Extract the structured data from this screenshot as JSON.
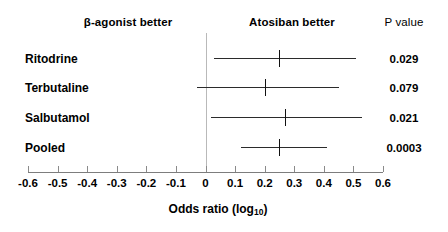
{
  "header": {
    "left_label": "β-agonist better",
    "right_label": "Atosiban better",
    "pvalue_label": "P value"
  },
  "axis": {
    "title_main": "Odds ratio (log",
    "title_sub": "10",
    "title_close": ")",
    "tick_labels": [
      "-0.6",
      "-0.5",
      "-0.4",
      "-0.3",
      "-0.2",
      "-0.1",
      "0",
      "0.1",
      "0.2",
      "0.3",
      "0.4",
      "0.5",
      "0.6"
    ],
    "tick_values": [
      -0.6,
      -0.5,
      -0.4,
      -0.3,
      -0.2,
      -0.1,
      0,
      0.1,
      0.2,
      0.3,
      0.4,
      0.5,
      0.6
    ],
    "min": -0.6,
    "max": 0.6,
    "zero_reference": 0
  },
  "rows": [
    {
      "label": "Ritodrine",
      "pvalue": "0.029",
      "estimate": 0.25,
      "ci_low": 0.03,
      "ci_high": 0.51
    },
    {
      "label": "Terbutaline",
      "pvalue": "0.079",
      "estimate": 0.2,
      "ci_low": -0.03,
      "ci_high": 0.45
    },
    {
      "label": "Salbutamol",
      "pvalue": "0.021",
      "estimate": 0.27,
      "ci_low": 0.02,
      "ci_high": 0.53
    },
    {
      "label": "Pooled",
      "pvalue": "0.0003",
      "estimate": 0.25,
      "ci_low": 0.12,
      "ci_high": 0.41
    }
  ],
  "colors": {
    "line": "#2b2b2b",
    "axis": "#7d7d7d",
    "zero_line": "#b9b9b9",
    "text": "#000000",
    "background": "#ffffff"
  },
  "chart_data": {
    "type": "scatter",
    "chart_subtype": "forest-plot",
    "title": "",
    "xlabel": "Odds ratio (log10)",
    "ylabel": "",
    "xlim": [
      -0.6,
      0.6
    ],
    "xticks": [
      -0.6,
      -0.5,
      -0.4,
      -0.3,
      -0.2,
      -0.1,
      0,
      0.1,
      0.2,
      0.3,
      0.4,
      0.5,
      0.6
    ],
    "xticklabels": [
      "-0.6",
      "-0.5",
      "-0.4",
      "-0.3",
      "-0.2",
      "-0.1",
      "0",
      "0.1",
      "0.2",
      "0.3",
      "0.4",
      "0.5",
      "0.6"
    ],
    "grid": false,
    "legend": false,
    "reference_line": 0,
    "annotations": [
      "β-agonist better",
      "Atosiban better",
      "P value"
    ],
    "categories": [
      "Ritodrine",
      "Terbutaline",
      "Salbutamol",
      "Pooled"
    ],
    "values": [
      0.25,
      0.2,
      0.27,
      0.25
    ],
    "ci_low": [
      0.03,
      -0.03,
      0.02,
      0.12
    ],
    "ci_high": [
      0.51,
      0.45,
      0.53,
      0.41
    ],
    "p_values": [
      "0.029",
      "0.079",
      "0.021",
      "0.0003"
    ]
  }
}
